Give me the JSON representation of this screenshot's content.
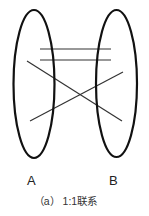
{
  "diagram": {
    "stroke_color": "#111111",
    "line_color": "#333333",
    "sets": [
      {
        "label": "A",
        "cx": 34,
        "cy": 84,
        "rx": 20.5,
        "ry": 74,
        "label_x": 27,
        "label_y": 174
      },
      {
        "label": "B",
        "cx": 116.5,
        "cy": 83.5,
        "rx": 20.5,
        "ry": 73.5,
        "label_x": 109,
        "label_y": 174
      }
    ],
    "connections": [
      {
        "x1": 40,
        "y1": 49,
        "x2": 111,
        "y2": 49
      },
      {
        "x1": 40,
        "y1": 60,
        "x2": 111,
        "y2": 60
      },
      {
        "x1": 27,
        "y1": 61,
        "x2": 122,
        "y2": 121
      },
      {
        "x1": 30,
        "y1": 121,
        "x2": 123,
        "y2": 72
      }
    ],
    "caption": "（a） 1:1联系"
  }
}
